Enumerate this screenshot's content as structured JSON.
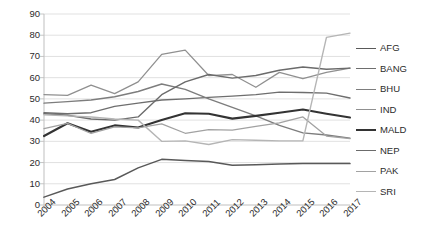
{
  "chart_data": {
    "type": "line",
    "title": "",
    "subtitle": "",
    "xlabel": "",
    "ylabel": "",
    "xlim": [
      2004,
      2017
    ],
    "ylim": [
      0,
      90
    ],
    "y_ticks": [
      0,
      10,
      20,
      30,
      40,
      50,
      60,
      70,
      80,
      90
    ],
    "grid": "horizontal",
    "legend_position": "right",
    "categories": [
      "2004",
      "2005",
      "2006",
      "2007",
      "2008",
      "2009",
      "2010",
      "2011",
      "2012",
      "2013",
      "2014",
      "2015",
      "2016",
      "2017"
    ],
    "series": [
      {
        "name": "AFG",
        "color": "#595959",
        "width": 1.5,
        "values": [
          3.7,
          7.5,
          10.0,
          12.0,
          17.5,
          21.5,
          21.0,
          20.5,
          18.7,
          19.0,
          19.3,
          19.6,
          19.6,
          19.5
        ]
      },
      {
        "name": "BANG",
        "color": "#6e6e6e",
        "width": 1.4,
        "values": [
          43.5,
          43.0,
          43.5,
          46.5,
          48.0,
          49.5,
          50.0,
          50.7,
          51.3,
          52.0,
          53.2,
          53.0,
          52.7,
          50.4
        ]
      },
      {
        "name": "BHU",
        "color": "#7d7d7d",
        "width": 1.4,
        "values": [
          48.0,
          48.7,
          49.5,
          51.0,
          53.5,
          57.0,
          54.5,
          50.0,
          46.0,
          42.0,
          37.5,
          34.0,
          33.0,
          31.5
        ]
      },
      {
        "name": "IND",
        "color": "#909090",
        "width": 1.3,
        "values": [
          52.0,
          51.7,
          56.5,
          52.5,
          58.0,
          71.0,
          73.0,
          61.0,
          61.5,
          55.5,
          62.5,
          59.5,
          62.5,
          64.5
        ]
      },
      {
        "name": "MALD",
        "color": "#333333",
        "width": 2.1,
        "values": [
          32.5,
          38.5,
          34.5,
          37.5,
          36.5,
          40.0,
          43.2,
          43.0,
          40.7,
          42.0,
          43.5,
          45.0,
          43.0,
          41.2
        ]
      },
      {
        "name": "NEP",
        "color": "#6b6b6b",
        "width": 1.4,
        "values": [
          43.0,
          42.3,
          40.5,
          40.0,
          41.5,
          52.0,
          58.0,
          61.5,
          59.8,
          61.0,
          63.5,
          65.0,
          64.0,
          64.5
        ]
      },
      {
        "name": "PAK",
        "color": "#a2a2a2",
        "width": 1.3,
        "values": [
          36.0,
          38.5,
          33.7,
          36.8,
          36.3,
          38.2,
          33.8,
          35.5,
          35.3,
          37.0,
          38.7,
          41.5,
          32.5,
          31.3
        ]
      },
      {
        "name": "SRI",
        "color": "#b5b5b5",
        "width": 1.4,
        "values": [
          42.5,
          42.0,
          41.5,
          40.5,
          40.0,
          30.0,
          30.2,
          28.5,
          30.8,
          30.5,
          30.2,
          30.3,
          79.0,
          81.0
        ]
      }
    ],
    "legend": [
      {
        "label": "AFG",
        "color": "#595959",
        "width": 1.8
      },
      {
        "label": "BANG",
        "color": "#6e6e6e",
        "width": 1.6
      },
      {
        "label": "BHU",
        "color": "#7d7d7d",
        "width": 1.6
      },
      {
        "label": "IND",
        "color": "#909090",
        "width": 1.4
      },
      {
        "label": "MALD",
        "color": "#333333",
        "width": 2.4
      },
      {
        "label": "NEP",
        "color": "#6b6b6b",
        "width": 1.6
      },
      {
        "label": "PAK",
        "color": "#a2a2a2",
        "width": 1.4
      },
      {
        "label": "SRI",
        "color": "#b5b5b5",
        "width": 1.4
      }
    ],
    "axis_color": "#bfbfbf",
    "grid_color": "#d9d9d9",
    "text_color": "#2b2b2b"
  }
}
